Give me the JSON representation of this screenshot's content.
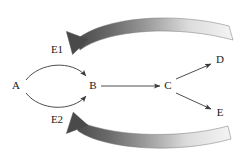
{
  "diagram": {
    "type": "pathway-diagram",
    "background_color": "#ffffff",
    "line_color": "#3a3a3a",
    "label_color": "#1a1a1a",
    "feedback_arrow_dark": "#4a4a4a",
    "feedback_arrow_light": "#f0f0f0",
    "nodes": [
      {
        "id": "A",
        "label": "A",
        "x": 16,
        "y": 86
      },
      {
        "id": "B",
        "label": "B",
        "x": 93,
        "y": 86
      },
      {
        "id": "C",
        "label": "C",
        "x": 168,
        "y": 86
      },
      {
        "id": "D",
        "label": "D",
        "x": 220,
        "y": 60
      },
      {
        "id": "E",
        "label": "E",
        "x": 220,
        "y": 113
      },
      {
        "id": "E1",
        "label": "E1",
        "x": 57,
        "y": 50
      },
      {
        "id": "E2",
        "label": "E2",
        "x": 57,
        "y": 120
      }
    ],
    "edges": [
      {
        "id": "a-to-b-upper",
        "from": "A",
        "to": "B",
        "style": "thin-curved-arc",
        "enzyme": "E1"
      },
      {
        "id": "a-to-b-lower",
        "from": "A",
        "to": "B",
        "style": "thin-curved-arc",
        "enzyme": "E2"
      },
      {
        "id": "b-to-c",
        "from": "B",
        "to": "C",
        "style": "thin-straight-arrow"
      },
      {
        "id": "c-to-d",
        "from": "C",
        "to": "D",
        "style": "thin-straight-arrow"
      },
      {
        "id": "c-to-e",
        "from": "C",
        "to": "E",
        "style": "thin-straight-arrow"
      }
    ],
    "feedback_arrows": [
      {
        "id": "feedback-to-e1",
        "from": "right",
        "to": "E1",
        "style": "thick-gradient-curved-arrow",
        "position": "top"
      },
      {
        "id": "feedback-to-e2",
        "from": "right",
        "to": "E2",
        "style": "thick-gradient-curved-arrow",
        "position": "bottom"
      }
    ]
  }
}
